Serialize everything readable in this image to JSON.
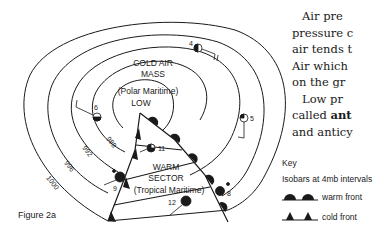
{
  "figure": {
    "label": "Figure 2a",
    "cold_air_mass": {
      "line1": "COLD AIR",
      "line2": "MASS",
      "line3": "(Polar Maritime)",
      "line4": "LOW"
    },
    "warm_sector": {
      "line1": "WARM",
      "line2": "SECTOR",
      "line3": "(Tropical Maritime)"
    },
    "isobars": [
      "988",
      "992",
      "996",
      "1000"
    ],
    "stations": [
      {
        "id": "4",
        "cover": "half"
      },
      {
        "id": "5",
        "cover": "quarter"
      },
      {
        "id": "6",
        "cover": "quarter"
      },
      {
        "id": "8",
        "cover": "full"
      },
      {
        "id": "9",
        "cover": "full"
      },
      {
        "id": "11",
        "cover": "three-quarter"
      },
      {
        "id": "12",
        "cover": "full"
      }
    ]
  },
  "key": {
    "title": "Key",
    "isobar_note": "Isobars at 4mb intervals",
    "warm_front_label": "warm front",
    "cold_front_label": "cold front"
  },
  "body_text": {
    "lines": [
      "Air pre",
      "pressure c",
      "air tends t",
      "Air which",
      "on the gr",
      "Low pr",
      "called ",
      "and anticy"
    ],
    "bold_fragment": "ant"
  },
  "colors": {
    "ink": "#1a1a1a",
    "background": "#ffffff"
  }
}
